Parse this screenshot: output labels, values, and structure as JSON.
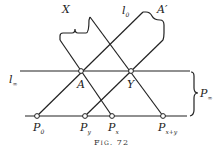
{
  "figure": {
    "caption": "Fig. 72",
    "lines": {
      "l_inf": {
        "label": "l",
        "sub": "∞"
      },
      "l_0": {
        "label": "l",
        "sub": "0"
      }
    },
    "points": {
      "A": "A",
      "Y": "Y",
      "P0": {
        "label": "P",
        "sub": "0"
      },
      "Py": {
        "label": "P",
        "sub": "y"
      },
      "Px": {
        "label": "P",
        "sub": "x"
      },
      "Pxy": {
        "label": "P",
        "sub": "x+y"
      }
    },
    "braces": {
      "X": "X",
      "A_prime": "A′",
      "P_inf": {
        "label": "P",
        "sub": "∞"
      }
    }
  }
}
